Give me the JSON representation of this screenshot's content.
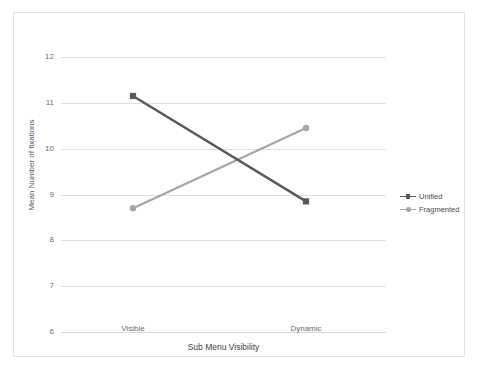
{
  "chart_data": {
    "type": "line",
    "title": "",
    "xlabel": "Sub Menu Visibility",
    "ylabel": "Mean Number of fixations",
    "categories": [
      "Visible",
      "Dynamic"
    ],
    "yticks": [
      12,
      11,
      10,
      9,
      8,
      7,
      6
    ],
    "ylim": [
      6,
      12
    ],
    "grid": true,
    "legend_position": "right",
    "series": [
      {
        "name": "Unified",
        "values": [
          11.15,
          8.85
        ],
        "color": "#595959"
      },
      {
        "name": "Fragmented",
        "values": [
          8.7,
          10.45
        ],
        "color": "#a6a6a6"
      }
    ]
  },
  "legend": {
    "items": [
      {
        "label": "Unified"
      },
      {
        "label": "Fragmented"
      }
    ]
  },
  "axes": {
    "y_tick_labels": [
      "12",
      "11",
      "10",
      "9",
      "8",
      "7",
      "6"
    ],
    "x_tick_labels": [
      "Visible",
      "Dynamic"
    ],
    "y_axis_title": "Mean Number of fixations",
    "x_axis_title": "Sub Menu Visibility"
  },
  "colors": {
    "series_unified": "#595959",
    "series_fragmented": "#a6a6a6",
    "gridline": "#e0e0e0",
    "frame": "#e3e3e3",
    "tick_text": "#6e6e6e"
  }
}
